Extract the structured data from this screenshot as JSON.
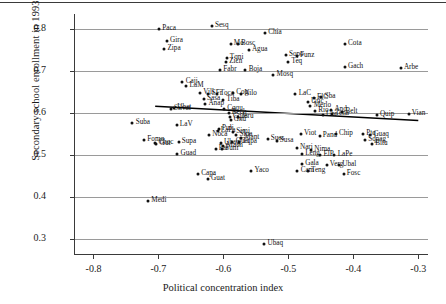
{
  "chart_data": {
    "type": "scatter",
    "title": "",
    "xlabel": "Political concentration index",
    "ylabel": "Secondary school enrollment in 1993",
    "xlim": [
      -0.83,
      -0.285
    ],
    "ylim": [
      0.265,
      0.835
    ],
    "xticks": [
      "-0.8",
      "-0.7",
      "-0.6",
      "-0.5",
      "-0.4",
      "-0.3"
    ],
    "xtick_values": [
      -0.8,
      -0.7,
      -0.6,
      -0.5,
      -0.4,
      -0.3
    ],
    "yticks": [
      "0.8",
      "0.7",
      "0.6",
      "0.5",
      "0.4",
      "0.3"
    ],
    "ytick_values": [
      0.8,
      0.7,
      0.6,
      0.5,
      0.4,
      0.3
    ],
    "grid": "horizontal",
    "legend": "none",
    "fit_line": {
      "x1": -0.705,
      "y1": 0.616,
      "x2": -0.3,
      "y2": 0.582
    },
    "points": [
      {
        "label": "Sesq",
        "x": -0.618,
        "y": 0.806,
        "pos": "right"
      },
      {
        "label": "Paca",
        "x": -0.699,
        "y": 0.8,
        "pos": "right"
      },
      {
        "label": "Chia",
        "x": -0.536,
        "y": 0.79,
        "pos": "right"
      },
      {
        "label": "Gira",
        "x": -0.687,
        "y": 0.771,
        "pos": "right"
      },
      {
        "label": "Mo",
        "x": -0.589,
        "y": 0.763,
        "pos": "right"
      },
      {
        "label": "Bosc",
        "x": -0.578,
        "y": 0.763,
        "pos": "right"
      },
      {
        "label": "Cota",
        "x": -0.413,
        "y": 0.763,
        "pos": "right"
      },
      {
        "label": "Zipa",
        "x": -0.691,
        "y": 0.753,
        "pos": "right"
      },
      {
        "label": "Agua",
        "x": -0.561,
        "y": 0.75,
        "pos": "right"
      },
      {
        "label": "Sopo",
        "x": -0.504,
        "y": 0.737,
        "pos": "right"
      },
      {
        "label": "Funz",
        "x": -0.487,
        "y": 0.735,
        "pos": "right"
      },
      {
        "label": "Tqni",
        "x": -0.595,
        "y": 0.731,
        "pos": "right"
      },
      {
        "label": "Zicn",
        "x": -0.596,
        "y": 0.722,
        "pos": "right"
      },
      {
        "label": "Teq",
        "x": -0.5,
        "y": 0.722,
        "pos": "right"
      },
      {
        "label": "Gach",
        "x": -0.413,
        "y": 0.708,
        "pos": "right"
      },
      {
        "label": "Arbe",
        "x": -0.327,
        "y": 0.707,
        "pos": "right"
      },
      {
        "label": "Fabr",
        "x": -0.605,
        "y": 0.703,
        "pos": "right"
      },
      {
        "label": "Boja",
        "x": -0.566,
        "y": 0.703,
        "pos": "right"
      },
      {
        "label": "Mosq",
        "x": -0.523,
        "y": 0.691,
        "pos": "right"
      },
      {
        "label": "Caji",
        "x": -0.663,
        "y": 0.674,
        "pos": "right"
      },
      {
        "label": "LaM",
        "x": -0.657,
        "y": 0.663,
        "pos": "right"
      },
      {
        "label": "Vill",
        "x": -0.636,
        "y": 0.648,
        "pos": "right"
      },
      {
        "label": "SFr",
        "x": -0.623,
        "y": 0.645,
        "pos": "right"
      },
      {
        "label": "Toca",
        "x": -0.61,
        "y": 0.645,
        "pos": "right"
      },
      {
        "label": "Cog",
        "x": -0.585,
        "y": 0.648,
        "pos": "right"
      },
      {
        "label": "Nilo",
        "x": -0.573,
        "y": 0.644,
        "pos": "right"
      },
      {
        "label": "LaC",
        "x": -0.489,
        "y": 0.644,
        "pos": "right"
      },
      {
        "label": "Sasa",
        "x": -0.63,
        "y": 0.634,
        "pos": "right"
      },
      {
        "label": "Tiba",
        "x": -0.6,
        "y": 0.631,
        "pos": "right"
      },
      {
        "label": "ElC",
        "x": -0.461,
        "y": 0.636,
        "pos": "right"
      },
      {
        "label": "Sba",
        "x": -0.449,
        "y": 0.637,
        "pos": "right"
      },
      {
        "label": "Uric",
        "x": -0.47,
        "y": 0.625,
        "pos": "right"
      },
      {
        "label": "Anap",
        "x": -0.628,
        "y": 0.621,
        "pos": "right"
      },
      {
        "label": "Ubat",
        "x": -0.676,
        "y": 0.611,
        "pos": "right"
      },
      {
        "label": "Silvat",
        "x": -0.681,
        "y": 0.609,
        "pos": "right"
      },
      {
        "label": "Cqqu",
        "x": -0.599,
        "y": 0.61,
        "pos": "right"
      },
      {
        "label": "Merlo",
        "x": -0.466,
        "y": 0.617,
        "pos": "right"
      },
      {
        "label": "Rio",
        "x": -0.459,
        "y": 0.604,
        "pos": "right"
      },
      {
        "label": "And",
        "x": -0.434,
        "y": 0.607,
        "pos": "right"
      },
      {
        "label": "Belt",
        "x": -0.417,
        "y": 0.603,
        "pos": "right"
      },
      {
        "label": "Tena",
        "x": -0.433,
        "y": 0.598,
        "pos": "right"
      },
      {
        "label": "Ubr",
        "x": -0.447,
        "y": 0.594,
        "pos": "right"
      },
      {
        "label": "Quip",
        "x": -0.364,
        "y": 0.595,
        "pos": "right"
      },
      {
        "label": "Vian",
        "x": -0.315,
        "y": 0.598,
        "pos": "right"
      },
      {
        "label": "Bech",
        "x": -0.592,
        "y": 0.6,
        "pos": "right"
      },
      {
        "label": "Cqos",
        "x": -0.59,
        "y": 0.591,
        "pos": "right"
      },
      {
        "label": "Gnu",
        "x": -0.589,
        "y": 0.584,
        "pos": "right"
      },
      {
        "label": "Jeru",
        "x": -0.577,
        "y": 0.591,
        "pos": "right"
      },
      {
        "label": "Suba",
        "x": -0.74,
        "y": 0.575,
        "pos": "right"
      },
      {
        "label": "LaV",
        "x": -0.672,
        "y": 0.571,
        "pos": "right"
      },
      {
        "label": "Puli",
        "x": -0.607,
        "y": 0.561,
        "pos": "right"
      },
      {
        "label": "Simi",
        "x": -0.585,
        "y": 0.555,
        "pos": "right"
      },
      {
        "label": "Viot",
        "x": -0.481,
        "y": 0.55,
        "pos": "right"
      },
      {
        "label": "Chip",
        "x": -0.427,
        "y": 0.551,
        "pos": "right"
      },
      {
        "label": "Noca",
        "x": -0.622,
        "y": 0.548,
        "pos": "right"
      },
      {
        "label": "LaPa",
        "x": -0.609,
        "y": 0.556,
        "pos": "right"
      },
      {
        "label": "Slua",
        "x": -0.58,
        "y": 0.548,
        "pos": "right"
      },
      {
        "label": "Pand",
        "x": -0.452,
        "y": 0.546,
        "pos": "right"
      },
      {
        "label": "Ptq",
        "x": -0.385,
        "y": 0.549,
        "pos": "right"
      },
      {
        "label": "Guaq",
        "x": -0.374,
        "y": 0.548,
        "pos": "right"
      },
      {
        "label": "Fomq",
        "x": -0.722,
        "y": 0.535,
        "pos": "right"
      },
      {
        "label": "Choc",
        "x": -0.705,
        "y": 0.528,
        "pos": "right"
      },
      {
        "label": "Gut",
        "x": -0.703,
        "y": 0.526,
        "pos": "right"
      },
      {
        "label": "Supa",
        "x": -0.669,
        "y": 0.53,
        "pos": "right"
      },
      {
        "label": "Mant",
        "x": -0.573,
        "y": 0.54,
        "pos": "right"
      },
      {
        "label": "Sues",
        "x": -0.532,
        "y": 0.539,
        "pos": "right"
      },
      {
        "label": "Susa",
        "x": -0.518,
        "y": 0.533,
        "pos": "right"
      },
      {
        "label": "Ubaq",
        "x": -0.604,
        "y": 0.529,
        "pos": "right"
      },
      {
        "label": "Quet",
        "x": -0.586,
        "y": 0.531,
        "pos": "right"
      },
      {
        "label": "Tqpa",
        "x": -0.576,
        "y": 0.53,
        "pos": "right"
      },
      {
        "label": "Mach",
        "x": -0.6,
        "y": 0.522,
        "pos": "right"
      },
      {
        "label": "Sqpag",
        "x": -0.382,
        "y": 0.535,
        "pos": "right"
      },
      {
        "label": "Bitu",
        "x": -0.371,
        "y": 0.527,
        "pos": "right"
      },
      {
        "label": "Pas",
        "x": -0.612,
        "y": 0.515,
        "pos": "right"
      },
      {
        "label": "Funi",
        "x": -0.602,
        "y": 0.515,
        "pos": "right"
      },
      {
        "label": "Nari",
        "x": -0.487,
        "y": 0.516,
        "pos": "right"
      },
      {
        "label": "Nima",
        "x": -0.465,
        "y": 0.512,
        "pos": "right"
      },
      {
        "label": "Leng",
        "x": -0.479,
        "y": 0.503,
        "pos": "right"
      },
      {
        "label": "ElP",
        "x": -0.451,
        "y": 0.5,
        "pos": "right"
      },
      {
        "label": "LaPe",
        "x": -0.429,
        "y": 0.501,
        "pos": "right"
      },
      {
        "label": "Guad",
        "x": -0.671,
        "y": 0.503,
        "pos": "right"
      },
      {
        "label": "Gala",
        "x": -0.479,
        "y": 0.478,
        "pos": "right"
      },
      {
        "label": "Verg",
        "x": -0.441,
        "y": 0.477,
        "pos": "right"
      },
      {
        "label": "Ubal",
        "x": -0.422,
        "y": 0.476,
        "pos": "right"
      },
      {
        "label": "Yaco",
        "x": -0.557,
        "y": 0.463,
        "pos": "right"
      },
      {
        "label": "Capa",
        "x": -0.639,
        "y": 0.456,
        "pos": "right"
      },
      {
        "label": "Guat",
        "x": -0.624,
        "y": 0.442,
        "pos": "right"
      },
      {
        "label": "Cam",
        "x": -0.486,
        "y": 0.463,
        "pos": "right"
      },
      {
        "label": "Teng",
        "x": -0.47,
        "y": 0.461,
        "pos": "right"
      },
      {
        "label": "Fosc",
        "x": -0.415,
        "y": 0.455,
        "pos": "right"
      },
      {
        "label": "Medi",
        "x": -0.716,
        "y": 0.392,
        "pos": "right"
      },
      {
        "label": "Ubaq",
        "x": -0.537,
        "y": 0.289,
        "pos": "right"
      }
    ]
  }
}
